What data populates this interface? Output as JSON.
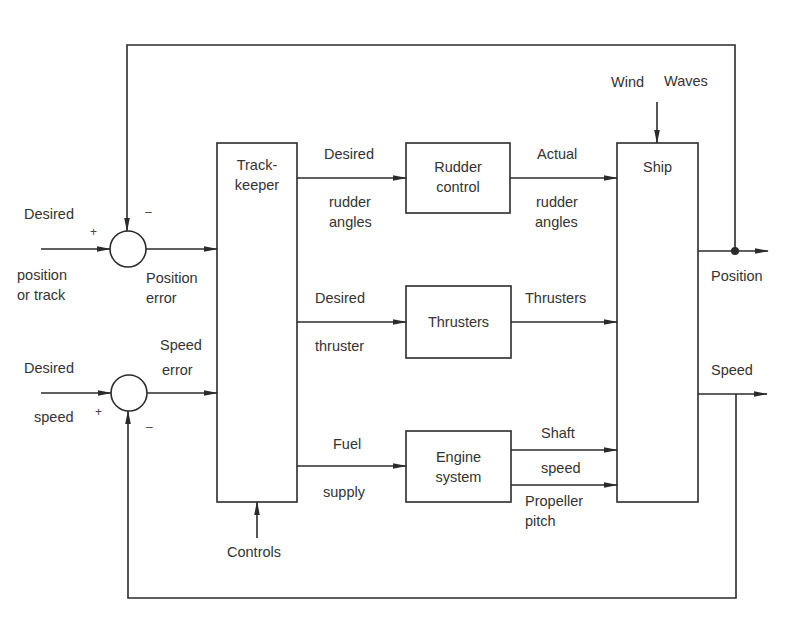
{
  "diagram": {
    "type": "block-diagram",
    "blocks": {
      "trackkeeper": {
        "line1": "Track-",
        "line2": "keeper"
      },
      "rudder_control": {
        "line1": "Rudder",
        "line2": "control"
      },
      "thrusters": {
        "line1": "Thrusters"
      },
      "engine_system": {
        "line1": "Engine",
        "line2": "system"
      },
      "ship": {
        "line1": "Ship"
      }
    },
    "summing_junctions": {
      "position": {
        "plus": "+",
        "minus": "–"
      },
      "speed": {
        "plus": "+",
        "minus": "–"
      }
    },
    "labels": {
      "desired_position_1": "Desired",
      "desired_position_2": "position",
      "desired_position_3": "or track",
      "position_error_1": "Position",
      "position_error_2": "error",
      "desired_speed_1": "Desired",
      "desired_speed_2": "speed",
      "speed_error_1": "Speed",
      "speed_error_2": "error",
      "desired_rudder_1": "Desired",
      "desired_rudder_2": "rudder",
      "desired_rudder_3": "angles",
      "actual_rudder_1": "Actual",
      "actual_rudder_2": "rudder",
      "actual_rudder_3": "angles",
      "desired_thruster_1": "Desired",
      "desired_thruster_2": "thruster",
      "thrusters_out": "Thrusters",
      "fuel_supply_1": "Fuel",
      "fuel_supply_2": "supply",
      "shaft_speed_1": "Shaft",
      "shaft_speed_2": "speed",
      "propeller_pitch_1": "Propeller",
      "propeller_pitch_2": "pitch",
      "wind": "Wind",
      "waves": "Waves",
      "position_out": "Position",
      "speed_out": "Speed",
      "controls": "Controls"
    },
    "colors": {
      "line": "#2b2b2b",
      "background": "#ffffff"
    }
  }
}
